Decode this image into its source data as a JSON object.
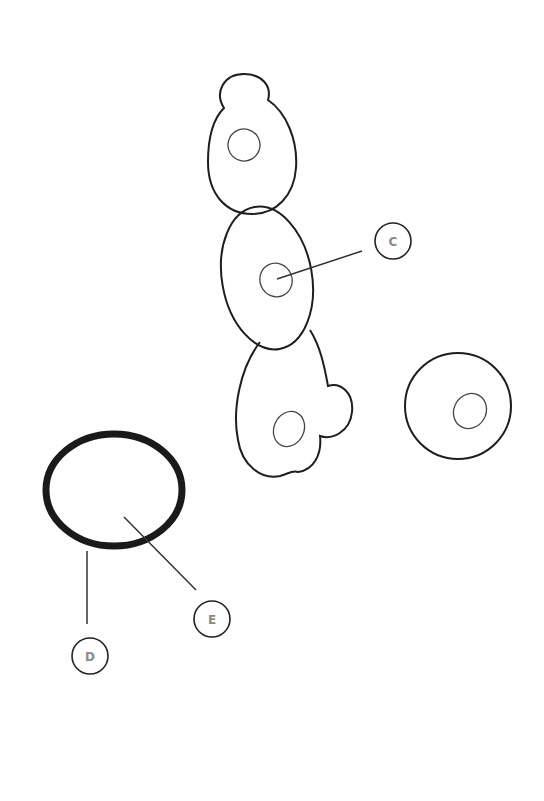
{
  "diagram": {
    "labels": [
      {
        "id": "C",
        "text": "C",
        "target": "nucleus of middle cell"
      },
      {
        "id": "D",
        "text": "D",
        "target": "thick ring outline"
      },
      {
        "id": "E",
        "text": "E",
        "target": "interior of thick ring"
      }
    ],
    "colors": {
      "outline": "#1e1e1e",
      "label_text": "#8a8a8a",
      "background": "#ffffff"
    }
  }
}
